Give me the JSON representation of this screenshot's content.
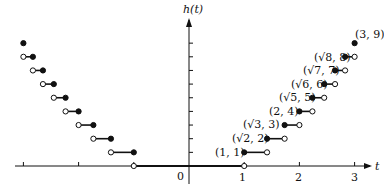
{
  "chart_data": {
    "type": "line",
    "subtype": "step-function",
    "title": "",
    "xlabel": "t",
    "ylabel": "h(t)",
    "xlim": [
      -3.1,
      3.3
    ],
    "ylim": [
      0,
      10
    ],
    "x_ticks": [
      "-3",
      "-2",
      "-1",
      "0",
      "1",
      "2",
      "3"
    ],
    "x_tick_labels_shown": [
      "0",
      "1",
      "2",
      "3"
    ],
    "y_ticks": [
      1,
      2,
      3,
      4,
      5,
      6,
      7,
      8,
      9
    ],
    "grid": false,
    "segments": [
      {
        "h": 0,
        "x_start": -1,
        "x_end": 1,
        "start_closed": false,
        "end_closed": false
      },
      {
        "h": 1,
        "x_start": 1,
        "x_end": 1.414,
        "start_closed": true,
        "end_closed": false
      },
      {
        "h": 2,
        "x_start": 1.414,
        "x_end": 1.732,
        "start_closed": true,
        "end_closed": false
      },
      {
        "h": 3,
        "x_start": 1.732,
        "x_end": 2,
        "start_closed": true,
        "end_closed": false
      },
      {
        "h": 4,
        "x_start": 2,
        "x_end": 2.236,
        "start_closed": true,
        "end_closed": false
      },
      {
        "h": 5,
        "x_start": 2.236,
        "x_end": 2.449,
        "start_closed": true,
        "end_closed": false
      },
      {
        "h": 6,
        "x_start": 2.449,
        "x_end": 2.646,
        "start_closed": true,
        "end_closed": false
      },
      {
        "h": 7,
        "x_start": 2.646,
        "x_end": 2.828,
        "start_closed": true,
        "end_closed": false
      },
      {
        "h": 8,
        "x_start": 2.828,
        "x_end": 3,
        "start_closed": true,
        "end_closed": false
      },
      {
        "h": 9,
        "x_start": 3,
        "x_end": 3,
        "start_closed": true,
        "end_closed": true
      },
      {
        "h": 1,
        "x_start": -1.414,
        "x_end": -1,
        "start_closed": false,
        "end_closed": true
      },
      {
        "h": 2,
        "x_start": -1.732,
        "x_end": -1.414,
        "start_closed": false,
        "end_closed": true
      },
      {
        "h": 3,
        "x_start": -2,
        "x_end": -1.732,
        "start_closed": false,
        "end_closed": true
      },
      {
        "h": 4,
        "x_start": -2.236,
        "x_end": -2,
        "start_closed": false,
        "end_closed": true
      },
      {
        "h": 5,
        "x_start": -2.449,
        "x_end": -2.236,
        "start_closed": false,
        "end_closed": true
      },
      {
        "h": 6,
        "x_start": -2.646,
        "x_end": -2.449,
        "start_closed": false,
        "end_closed": true
      },
      {
        "h": 7,
        "x_start": -2.828,
        "x_end": -2.646,
        "start_closed": false,
        "end_closed": true
      },
      {
        "h": 8,
        "x_start": -3,
        "x_end": -2.828,
        "start_closed": false,
        "end_closed": true
      },
      {
        "h": 9,
        "x_start": -3,
        "x_end": -3,
        "start_closed": true,
        "end_closed": true
      }
    ],
    "annotations": [
      {
        "text": "(1, 1)",
        "x": 1,
        "y": 1
      },
      {
        "text": "(√2, 2)",
        "x": 1.414,
        "y": 2
      },
      {
        "text": "(√3, 3)",
        "x": 1.732,
        "y": 3
      },
      {
        "text": "(2, 4)",
        "x": 2,
        "y": 4
      },
      {
        "text": "(√5, 5)",
        "x": 2.236,
        "y": 5
      },
      {
        "text": "(√6, 6)",
        "x": 2.449,
        "y": 6
      },
      {
        "text": "(√7, 7)",
        "x": 2.646,
        "y": 7
      },
      {
        "text": "(√8, 8)",
        "x": 2.828,
        "y": 8
      },
      {
        "text": "(3, 9)",
        "x": 3,
        "y": 9
      }
    ]
  },
  "labels": {
    "y_axis": "h(t)",
    "x_axis": "t",
    "origin": "0",
    "tick_1": "1",
    "tick_2": "2",
    "tick_3": "3",
    "ann_1": "(1, 1)",
    "ann_2": "(√2, 2)",
    "ann_3": "(√3, 3)",
    "ann_4": "(2, 4)",
    "ann_5": "(√5, 5)",
    "ann_6": "(√6, 6)",
    "ann_7": "(√7, 7)",
    "ann_8": "(√8, 8)",
    "ann_9": "(3, 9)"
  }
}
